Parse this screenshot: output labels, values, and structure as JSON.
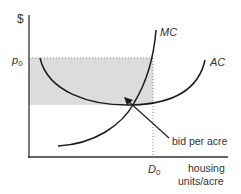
{
  "diagram": {
    "y_axis_label": "$",
    "price_label": "p",
    "price_sub": "0",
    "quantity_label": "D",
    "quantity_sub": "0",
    "x_axis_label_line1": "housing",
    "x_axis_label_line2": "units/acre",
    "mc_label": "MC",
    "ac_label": "AC",
    "annotation": "bid per acre",
    "colors": {
      "axis": "#333333",
      "curve": "#1a1a1a",
      "shade": "#dcdcdc",
      "dotted": "#888888"
    }
  }
}
